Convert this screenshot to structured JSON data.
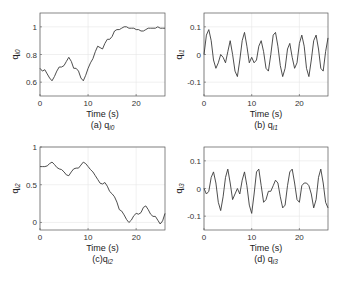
{
  "figure": {
    "xlabel": "Time (s)",
    "xlim": [
      0,
      26
    ],
    "xticks": [
      0,
      10,
      20
    ]
  },
  "chart_data": [
    {
      "type": "line",
      "id": "a",
      "caption": "(a) q",
      "caption_sub": "i0",
      "ylabel": "q",
      "ylabel_sub": "i0",
      "xlabel": "Time (s)",
      "xlim": [
        0,
        26
      ],
      "ylim": [
        0.5,
        1.1
      ],
      "yticks": [
        0.6,
        0.8,
        1
      ],
      "ytick_labels": [
        "0.6",
        "0.8",
        "1"
      ],
      "grid": true,
      "box": [
        40,
        13,
        165,
        96
      ],
      "x": [
        0,
        0.5,
        1,
        1.5,
        2,
        2.5,
        3,
        3.5,
        4,
        4.5,
        5,
        5.5,
        6,
        6.5,
        7,
        7.5,
        8,
        8.5,
        9,
        9.5,
        10,
        10.5,
        11,
        11.5,
        12,
        12.5,
        13,
        13.5,
        14,
        14.5,
        15,
        15.5,
        16,
        16.5,
        17,
        17.5,
        18,
        18.5,
        19,
        19.5,
        20,
        20.5,
        21,
        21.5,
        22,
        22.5,
        23,
        23.5,
        24,
        24.5,
        25,
        25.5,
        26
      ],
      "values": [
        0.7,
        0.68,
        0.69,
        0.66,
        0.63,
        0.61,
        0.64,
        0.68,
        0.71,
        0.71,
        0.72,
        0.75,
        0.78,
        0.75,
        0.7,
        0.7,
        0.68,
        0.63,
        0.61,
        0.65,
        0.7,
        0.74,
        0.77,
        0.82,
        0.86,
        0.85,
        0.84,
        0.88,
        0.91,
        0.91,
        0.93,
        0.97,
        0.98,
        0.98,
        0.99,
        1.0,
        1.0,
        0.99,
        0.99,
        0.99,
        0.98,
        0.98,
        0.97,
        0.97,
        0.98,
        0.99,
        0.99,
        0.99,
        0.99,
        1.0,
        0.99,
        0.99,
        0.99
      ]
    },
    {
      "type": "line",
      "id": "b",
      "caption": "(b) q",
      "caption_sub": "i1",
      "ylabel": "q",
      "ylabel_sub": "i1",
      "xlabel": "Time (s)",
      "xlim": [
        0,
        26
      ],
      "ylim": [
        -0.15,
        0.15
      ],
      "yticks": [
        -0.1,
        0,
        0.1
      ],
      "ytick_labels": [
        "-0.1",
        "0",
        "0.1"
      ],
      "grid": true,
      "box": [
        204,
        13,
        328,
        96
      ],
      "x": [
        0,
        0.5,
        1,
        1.5,
        2,
        2.5,
        3,
        3.5,
        4,
        4.5,
        5,
        5.5,
        6,
        6.5,
        7,
        7.5,
        8,
        8.5,
        9,
        9.5,
        10,
        10.5,
        11,
        11.5,
        12,
        12.5,
        13,
        13.5,
        14,
        14.5,
        15,
        15.5,
        16,
        16.5,
        17,
        17.5,
        18,
        18.5,
        19,
        19.5,
        20,
        20.5,
        21,
        21.5,
        22,
        22.5,
        23,
        23.5,
        24,
        24.5,
        25,
        25.5,
        26
      ],
      "values": [
        0.0,
        0.07,
        0.09,
        0.05,
        -0.02,
        -0.05,
        -0.03,
        0.0,
        -0.01,
        -0.03,
        0.01,
        0.05,
        0.0,
        -0.06,
        -0.08,
        -0.02,
        0.05,
        0.08,
        0.03,
        -0.03,
        -0.01,
        -0.03,
        -0.02,
        0.03,
        0.05,
        0.01,
        -0.05,
        -0.06,
        0.0,
        0.07,
        0.08,
        0.03,
        -0.04,
        -0.08,
        -0.05,
        0.02,
        0.04,
        -0.01,
        -0.05,
        -0.03,
        0.04,
        0.07,
        0.03,
        -0.05,
        -0.08,
        -0.02,
        0.05,
        0.07,
        0.02,
        -0.05,
        -0.06,
        0.01,
        0.06
      ]
    },
    {
      "type": "line",
      "id": "c",
      "caption": "(c)q",
      "caption_sub": "i2",
      "ylabel": "q",
      "ylabel_sub": "i2",
      "xlabel": "Time (s)",
      "xlim": [
        0,
        26
      ],
      "ylim": [
        -0.1,
        1
      ],
      "yticks": [
        0,
        0.5,
        1
      ],
      "ytick_labels": [
        "0",
        "0.5",
        "1"
      ],
      "grid": true,
      "box": [
        40,
        147,
        165,
        230
      ],
      "x": [
        0,
        0.5,
        1,
        1.5,
        2,
        2.5,
        3,
        3.5,
        4,
        4.5,
        5,
        5.5,
        6,
        6.5,
        7,
        7.5,
        8,
        8.5,
        9,
        9.5,
        10,
        10.5,
        11,
        11.5,
        12,
        12.5,
        13,
        13.5,
        14,
        14.5,
        15,
        15.5,
        16,
        16.5,
        17,
        17.5,
        18,
        18.5,
        19,
        19.5,
        20,
        20.5,
        21,
        21.5,
        22,
        22.5,
        23,
        23.5,
        24,
        24.5,
        25,
        25.5,
        26
      ],
      "values": [
        0.74,
        0.74,
        0.74,
        0.75,
        0.78,
        0.8,
        0.77,
        0.73,
        0.71,
        0.7,
        0.67,
        0.63,
        0.62,
        0.67,
        0.71,
        0.72,
        0.72,
        0.76,
        0.8,
        0.78,
        0.74,
        0.7,
        0.67,
        0.62,
        0.57,
        0.52,
        0.51,
        0.53,
        0.48,
        0.41,
        0.38,
        0.34,
        0.27,
        0.17,
        0.15,
        0.1,
        0.04,
        0.0,
        0.03,
        0.09,
        0.12,
        0.11,
        0.13,
        0.2,
        0.22,
        0.17,
        0.11,
        0.08,
        0.08,
        0.03,
        -0.02,
        0.02,
        0.12
      ]
    },
    {
      "type": "line",
      "id": "d",
      "caption": "(d) q",
      "caption_sub": "i3",
      "ylabel": "q",
      "ylabel_sub": "i3",
      "xlabel": "Time (s)",
      "xlim": [
        0,
        26
      ],
      "ylim": [
        -0.15,
        0.15
      ],
      "yticks": [
        -0.1,
        0,
        0.1
      ],
      "ytick_labels": [
        "-0.1",
        "0",
        "0.1"
      ],
      "grid": true,
      "box": [
        204,
        147,
        328,
        230
      ],
      "x": [
        0,
        0.5,
        1,
        1.5,
        2,
        2.5,
        3,
        3.5,
        4,
        4.5,
        5,
        5.5,
        6,
        6.5,
        7,
        7.5,
        8,
        8.5,
        9,
        9.5,
        10,
        10.5,
        11,
        11.5,
        12,
        12.5,
        13,
        13.5,
        14,
        14.5,
        15,
        15.5,
        16,
        16.5,
        17,
        17.5,
        18,
        18.5,
        19,
        19.5,
        20,
        20.5,
        21,
        21.5,
        22,
        22.5,
        23,
        23.5,
        24,
        24.5,
        25,
        25.5,
        26
      ],
      "values": [
        0.0,
        -0.02,
        -0.01,
        0.04,
        0.06,
        0.02,
        -0.05,
        -0.08,
        -0.03,
        0.04,
        0.07,
        0.02,
        -0.04,
        -0.02,
        0.0,
        -0.02,
        0.03,
        0.06,
        0.01,
        -0.06,
        -0.09,
        -0.02,
        0.06,
        0.07,
        0.01,
        -0.05,
        -0.04,
        -0.01,
        -0.01,
        0.01,
        0.03,
        0.02,
        -0.03,
        -0.07,
        -0.06,
        0.01,
        0.06,
        0.07,
        0.02,
        -0.04,
        -0.05,
        0.01,
        0.02,
        0.02,
        0.01,
        -0.02,
        -0.07,
        -0.04,
        0.04,
        0.07,
        0.02,
        -0.05,
        -0.07
      ]
    }
  ]
}
